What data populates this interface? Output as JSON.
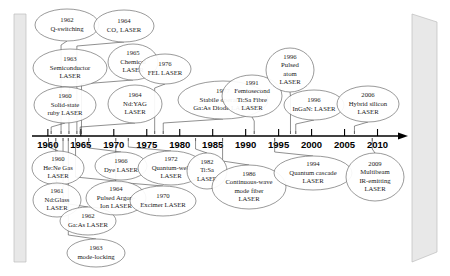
{
  "axis": {
    "name": "year-axis",
    "ticks": [
      1960,
      1965,
      1970,
      1975,
      1980,
      1985,
      1990,
      1995,
      2000,
      2005,
      2010
    ],
    "labels": [
      "1960",
      "1965",
      "1970",
      "1975",
      "1980",
      "1985",
      "1990",
      "1995",
      "2000",
      "2005",
      "2010"
    ],
    "start_year": 1958.2,
    "end_year": 2012.5,
    "x_start": 36,
    "x_end": 394,
    "y": 136
  },
  "decor": {
    "left_slab_name": "left-gray-bar",
    "right_slab_name": "right-gray-bar",
    "color": "#e8e8e8"
  },
  "events": [
    {
      "id": "q-switching",
      "year": 1962,
      "year_label": "1962",
      "lines": [
        "Q-switching"
      ],
      "side": "above",
      "cx": 67,
      "cy": 25,
      "rx": 32,
      "ry": 16,
      "anchor_year": 1962
    },
    {
      "id": "co2-laser",
      "year": 1964,
      "year_label": "1964",
      "lines": [
        "CO₂ LASER"
      ],
      "side": "above",
      "cx": 124,
      "cy": 26,
      "rx": 30,
      "ry": 16,
      "anchor_year": 1964.4
    },
    {
      "id": "chemical-laser",
      "year": 1965,
      "year_label": "1965",
      "lines": [
        "Chemical",
        "LASER"
      ],
      "side": "above",
      "cx": 133,
      "cy": 62,
      "rx": 25,
      "ry": 18,
      "anchor_year": 1965.1
    },
    {
      "id": "semiconductor-laser",
      "year": 1963,
      "year_label": "1963",
      "lines": [
        "Semiconductor",
        "LASER"
      ],
      "side": "above",
      "cx": 70,
      "cy": 68,
      "rx": 37,
      "ry": 19,
      "anchor_year": 1963.2
    },
    {
      "id": "solid-state-ruby-laser",
      "year": 1960,
      "year_label": "1960",
      "lines": [
        "Solid-state",
        "ruby LASER"
      ],
      "side": "above",
      "cx": 65,
      "cy": 105,
      "rx": 31,
      "ry": 18,
      "anchor_year": 1960.5
    },
    {
      "id": "ndyag-laser",
      "year": 1964,
      "year_label": "1964",
      "lines": [
        "Nd:YAG",
        "LASER"
      ],
      "side": "above",
      "cx": 135,
      "cy": 104,
      "rx": 27,
      "ry": 19,
      "anchor_year": 1964.9
    },
    {
      "id": "fel-laser",
      "year": 1976,
      "year_label": "1976",
      "lines": [
        "FEL LASER"
      ],
      "side": "above",
      "cx": 165,
      "cy": 69,
      "rx": 26,
      "ry": 15,
      "anchor_year": 1976.2
    },
    {
      "id": "gaas-diode-laser",
      "year": 1977,
      "year_label": "1977",
      "lines": [
        "Stabile operating",
        "Ga:As Diode LASER"
      ],
      "side": "above",
      "cx": 223,
      "cy": 100,
      "rx": 45,
      "ry": 19,
      "anchor_year": 1977.5
    },
    {
      "id": "femtosecond-tisa-fibre-laser",
      "year": 1991,
      "year_label": "1991",
      "lines": [
        "Femtosecond",
        "Ti:Sa  Fibre",
        "LASER"
      ],
      "side": "above",
      "cx": 252,
      "cy": 96,
      "rx": 30,
      "ry": 21,
      "anchor_year": 1991.3
    },
    {
      "id": "pulsed-atom-laser",
      "year": 1996,
      "year_label": "1996",
      "lines": [
        "Pulsed",
        "atom",
        "LASER"
      ],
      "side": "above",
      "cx": 290,
      "cy": 70,
      "rx": 24,
      "ry": 22,
      "anchor_year": 1996.8
    },
    {
      "id": "ingan-laser",
      "year": 1996,
      "year_label": "1996",
      "lines": [
        "InGaN: LASER"
      ],
      "side": "above",
      "cx": 314,
      "cy": 105,
      "rx": 30,
      "ry": 15,
      "anchor_year": 1997.6
    },
    {
      "id": "hybrid-silicon-laser",
      "year": 2006,
      "year_label": "2006",
      "lines": [
        "Hybrid silicon",
        "LASER"
      ],
      "side": "above",
      "cx": 368,
      "cy": 104,
      "rx": 31,
      "ry": 18,
      "anchor_year": 2006.5
    },
    {
      "id": "hene-gas-laser",
      "year": 1960,
      "year_label": "1960",
      "lines": [
        "He:Ne Gas",
        "LASER"
      ],
      "side": "below",
      "cx": 58,
      "cy": 168,
      "rx": 26,
      "ry": 17,
      "anchor_year": 1960.1
    },
    {
      "id": "ndglass-laser",
      "year": 1961,
      "year_label": "1961",
      "lines": [
        "Nd:Glass",
        "LASER"
      ],
      "side": "below",
      "cx": 57,
      "cy": 200,
      "rx": 24,
      "ry": 17,
      "anchor_year": 1961.2
    },
    {
      "id": "gaas-laser",
      "year": 1962,
      "year_label": "1962",
      "lines": [
        "Ga:As LASER"
      ],
      "side": "below",
      "cx": 88,
      "cy": 221,
      "rx": 28,
      "ry": 14,
      "anchor_year": 1962.3
    },
    {
      "id": "mode-locking",
      "year": 1963,
      "year_label": "1963",
      "lines": [
        "mode-locking"
      ],
      "side": "below",
      "cx": 96,
      "cy": 253,
      "rx": 29,
      "ry": 14,
      "anchor_year": 1963.1
    },
    {
      "id": "dye-laser",
      "year": 1966,
      "year_label": "1966",
      "lines": [
        "Dye LASER"
      ],
      "side": "below",
      "cx": 121,
      "cy": 166,
      "rx": 26,
      "ry": 14,
      "anchor_year": 1966.2
    },
    {
      "id": "pulsed-argon-ion-laser",
      "year": 1964,
      "year_label": "1964",
      "lines": [
        "Pulsed Argon-",
        "Ion LASER"
      ],
      "side": "below",
      "cx": 116,
      "cy": 198,
      "rx": 30,
      "ry": 17,
      "anchor_year": 1964.2
    },
    {
      "id": "quantum-well-laser",
      "year": 1972,
      "year_label": "1972",
      "lines": [
        "Quantum-well",
        "LASER"
      ],
      "side": "below",
      "cx": 171,
      "cy": 168,
      "rx": 33,
      "ry": 17,
      "anchor_year": 1972.2
    },
    {
      "id": "excimer-laser",
      "year": 1970,
      "year_label": "1970",
      "lines": [
        "Excimer LASER"
      ],
      "side": "below",
      "cx": 163,
      "cy": 201,
      "rx": 33,
      "ry": 15,
      "anchor_year": 1970.3
    },
    {
      "id": "tisa-laser",
      "year": 1982,
      "year_label": "1982",
      "lines": [
        "Ti:Sa",
        "LASER"
      ],
      "side": "below",
      "cx": 207,
      "cy": 171,
      "rx": 20,
      "ry": 18,
      "anchor_year": 1982.4
    },
    {
      "id": "cw-mode-fiber-laser",
      "year": 1986,
      "year_label": "1986",
      "lines": [
        "Continuous-wave",
        "mode fiber",
        "LASER"
      ],
      "side": "below",
      "cx": 249,
      "cy": 187,
      "rx": 37,
      "ry": 22,
      "anchor_year": 1986.5
    },
    {
      "id": "quantum-cascade-laser",
      "year": 1994,
      "year_label": "1994",
      "lines": [
        "Quantum cascade",
        "LASER"
      ],
      "side": "below",
      "cx": 313,
      "cy": 173,
      "rx": 39,
      "ry": 17,
      "anchor_year": 1994.4
    },
    {
      "id": "multibeam-ir-laser",
      "year": 2009,
      "year_label": "2009",
      "lines": [
        "Multibeam",
        "IR-emitting",
        "LASER"
      ],
      "side": "below",
      "cx": 375,
      "cy": 177,
      "rx": 29,
      "ry": 24,
      "anchor_year": 2009.2
    }
  ]
}
